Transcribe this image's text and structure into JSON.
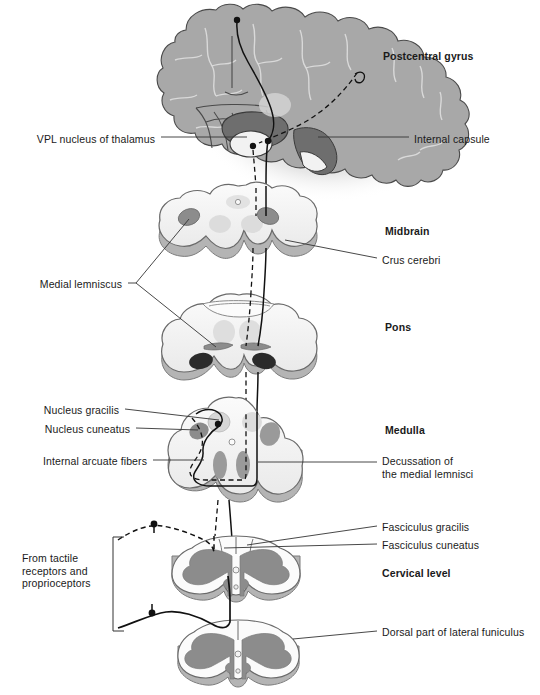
{
  "figure": {
    "width": 540,
    "height": 695,
    "background_color": "#ffffff"
  },
  "colors": {
    "ink": "#1a1a1a",
    "leader_line": "#333333",
    "brain_fill": "#a8a8a8",
    "brain_shadow": "#c2c2c2",
    "section_fill": "#f4f4f4",
    "section_rim": "#b4b4b4",
    "gray_matter": "#8c8c8c",
    "nucleus_mid": "#9a9a9a",
    "nucleus_light": "#d4d4d4",
    "nucleus_dark": "#2b2b2b",
    "internal_capsule": "#6e6e6e",
    "thalamus_light": "#efefef"
  },
  "labels": {
    "postcentral_gyrus": {
      "text": "Postcentral gyrus",
      "bold": true,
      "align": "left",
      "x": 383,
      "y": 57
    },
    "vpl_nucleus": {
      "text": "VPL nucleus of thalamus",
      "bold": false,
      "align": "right",
      "x": 155,
      "y": 140
    },
    "internal_capsule": {
      "text": "Internal capsule",
      "bold": false,
      "align": "left",
      "x": 414,
      "y": 140
    },
    "midbrain": {
      "text": "Midbrain",
      "bold": true,
      "align": "left",
      "x": 385,
      "y": 231
    },
    "crus_cerebri": {
      "text": "Crus cerebri",
      "bold": false,
      "align": "left",
      "x": 382,
      "y": 261
    },
    "medial_lemniscus": {
      "text": "Medial lemniscus",
      "bold": false,
      "align": "right",
      "x": 122,
      "y": 286
    },
    "pons": {
      "text": "Pons",
      "bold": true,
      "align": "left",
      "x": 385,
      "y": 327
    },
    "nucleus_gracilis": {
      "text": "Nucleus gracilis",
      "bold": false,
      "align": "right",
      "x": 119,
      "y": 412
    },
    "nucleus_cuneatus": {
      "text": "Nucleus cuneatus",
      "bold": false,
      "align": "right",
      "x": 130,
      "y": 431
    },
    "internal_arcuate_fibers": {
      "text": "Internal arcuate fibers",
      "bold": false,
      "align": "right",
      "x": 147,
      "y": 463
    },
    "medulla": {
      "text": "Medulla",
      "bold": true,
      "align": "left",
      "x": 385,
      "y": 430
    },
    "decussation": {
      "text": "Decussation of\nthe medial lemnisci",
      "bold": false,
      "align": "left",
      "x": 382,
      "y": 456
    },
    "fasciculus_gracilis": {
      "text": "Fasciculus gracilis",
      "bold": false,
      "align": "left",
      "x": 382,
      "y": 529
    },
    "fasciculus_cuneatus": {
      "text": "Fasciculus cuneatus",
      "bold": false,
      "align": "left",
      "x": 382,
      "y": 547
    },
    "cervical_level": {
      "text": "Cervical level",
      "bold": true,
      "align": "left",
      "x": 382,
      "y": 573
    },
    "from_tactile": {
      "text": "From tactile\nreceptors and\nproprioceptors",
      "bold": false,
      "align": "left",
      "x": 22,
      "y": 559
    },
    "dorsal_lateral_funiculus": {
      "text": "Dorsal part of lateral funiculus",
      "bold": false,
      "align": "left",
      "x": 382,
      "y": 634
    }
  },
  "sections": [
    {
      "name": "cerebrum",
      "label": "Postcentral gyrus"
    },
    {
      "name": "midbrain",
      "label": "Midbrain"
    },
    {
      "name": "pons",
      "label": "Pons"
    },
    {
      "name": "medulla",
      "label": "Medulla"
    },
    {
      "name": "cervical-cord-upper",
      "label": "Cervical level"
    },
    {
      "name": "cervical-cord-lower",
      "label": "Dorsal part of lateral funiculus"
    }
  ]
}
